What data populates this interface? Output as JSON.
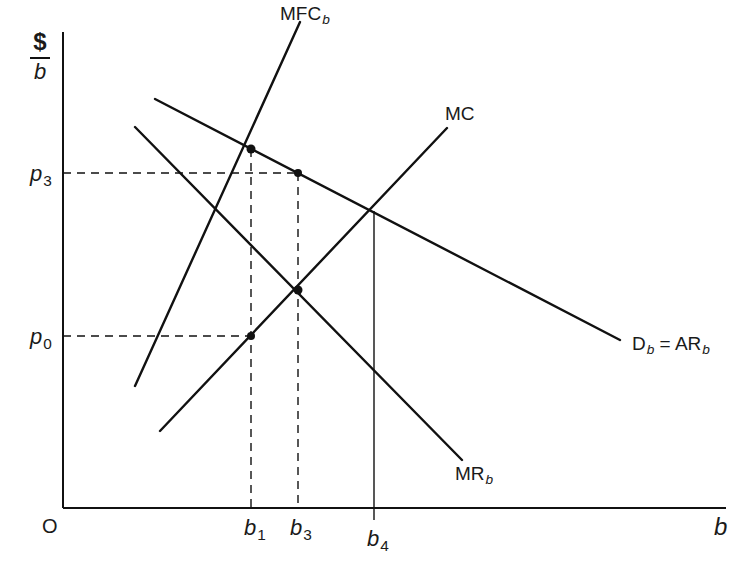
{
  "y_axis_label": {
    "numerator": "$",
    "denominator": "b"
  },
  "x_axis_label": "b",
  "origin_label": "O",
  "price_labels": [
    {
      "base": "p",
      "sub": "3"
    },
    {
      "base": "p",
      "sub": "0"
    }
  ],
  "quantity_labels": [
    {
      "base": "b",
      "sub": "1"
    },
    {
      "base": "b",
      "sub": "3"
    },
    {
      "base": "b",
      "sub": "4"
    }
  ],
  "curves": {
    "mfc": {
      "base": "MFC",
      "sub": "b"
    },
    "mc": {
      "base": "MC",
      "sub": ""
    },
    "demand": {
      "base": "D",
      "sub": "b",
      "eq": " = AR",
      "sub2": "b"
    },
    "mr": {
      "base": "MR",
      "sub": "b"
    }
  },
  "colors": {
    "line": "#111111",
    "background": "#ffffff"
  }
}
